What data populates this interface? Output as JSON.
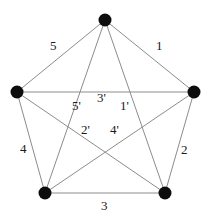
{
  "figure": {
    "background_color": "#ffffff",
    "edge_color": "#8c8c8c",
    "vertex_color": "#0d0d0d",
    "label_color": "#1a1a1a",
    "width": 211,
    "height": 219
  },
  "vertices": [
    {
      "id": "top",
      "name": "vertex-top",
      "x": 105,
      "y": 20,
      "r": 6.5
    },
    {
      "id": "right",
      "name": "vertex-right",
      "x": 194,
      "y": 92,
      "r": 6.5
    },
    {
      "id": "bottom-right",
      "name": "vertex-bottom-right",
      "x": 165,
      "y": 193,
      "r": 6.5
    },
    {
      "id": "bottom-left",
      "name": "vertex-bottom-left",
      "x": 45,
      "y": 193,
      "r": 6.5
    },
    {
      "id": "left",
      "name": "vertex-left",
      "x": 17,
      "y": 92,
      "r": 6.5
    }
  ],
  "edges": [
    {
      "id": "e1",
      "name": "edge-1",
      "from": "top",
      "to": "right",
      "label": "1",
      "label_x": 156,
      "label_y": 39
    },
    {
      "id": "e2",
      "name": "edge-2",
      "from": "right",
      "to": "bottom-right",
      "label": "2",
      "label_x": 181,
      "label_y": 143
    },
    {
      "id": "e3",
      "name": "edge-3",
      "from": "bottom-left",
      "to": "bottom-right",
      "label": "3",
      "label_x": 101,
      "label_y": 199
    },
    {
      "id": "e4",
      "name": "edge-4",
      "from": "left",
      "to": "bottom-left",
      "label": "4",
      "label_x": 20,
      "label_y": 142
    },
    {
      "id": "e5",
      "name": "edge-5",
      "from": "left",
      "to": "top",
      "label": "5",
      "label_x": 50,
      "label_y": 39
    },
    {
      "id": "e1p",
      "name": "edge-1-prime",
      "from": "top",
      "to": "bottom-right",
      "label": "1'",
      "label_x": 120,
      "label_y": 99
    },
    {
      "id": "e2p",
      "name": "edge-2-prime",
      "from": "bottom-right",
      "to": "left",
      "label": "2'",
      "label_x": 81,
      "label_y": 123
    },
    {
      "id": "e3p",
      "name": "edge-3-prime",
      "from": "left",
      "to": "right",
      "label": "3'",
      "label_x": 97,
      "label_y": 91
    },
    {
      "id": "e4p",
      "name": "edge-4-prime",
      "from": "right",
      "to": "bottom-left",
      "label": "4'",
      "label_x": 110,
      "label_y": 123
    },
    {
      "id": "e5p",
      "name": "edge-5-prime",
      "from": "bottom-left",
      "to": "top",
      "label": "5'",
      "label_x": 72,
      "label_y": 99
    }
  ]
}
